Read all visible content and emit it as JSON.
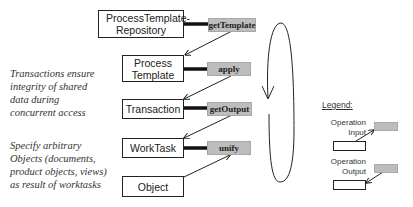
{
  "diagram": {
    "classes": [
      {
        "id": "repo",
        "label": "ProcessTemplate-Repository"
      },
      {
        "id": "template",
        "label": "Process Template"
      },
      {
        "id": "transaction",
        "label": "Transaction"
      },
      {
        "id": "worktask",
        "label": "WorkTask"
      },
      {
        "id": "object",
        "label": "Object"
      }
    ],
    "operations": [
      {
        "id": "getTemplate",
        "label": "getTemplate",
        "owner": "ProcessTemplate-Repository",
        "output_to": "Process Template"
      },
      {
        "id": "apply",
        "label": "apply",
        "owner": "Process Template",
        "output_to": "Transaction"
      },
      {
        "id": "getOutput",
        "label": "getOutput",
        "owner": "Transaction",
        "output_to": "WorkTask"
      },
      {
        "id": "unify",
        "label": "unify",
        "owner": "WorkTask",
        "input_from": "Object"
      }
    ],
    "loop": {
      "direction": "counter-clockwise, arrow pointing down on left side"
    },
    "notes": {
      "transactions": "Transactions ensure integrity of shared data during concurrent access",
      "transactions_lines": [
        "Transactions ensure",
        "integrity of shared",
        "data during",
        "concurrent access"
      ],
      "objects": "Specify arbitrary Objects (documents, product objects, views) as result of worktasks",
      "objects_lines": [
        "Specify arbitrary",
        "Objects (documents,",
        "product objects, views)",
        "as result of worktasks"
      ]
    },
    "legend": {
      "title": "Legend:",
      "input_label_1": "Operation",
      "input_label_2": "Input",
      "output_label_1": "Operation",
      "output_label_2": "Output"
    },
    "colors": {
      "operation_fill": "#bdbdbd",
      "line": "#222222"
    }
  }
}
